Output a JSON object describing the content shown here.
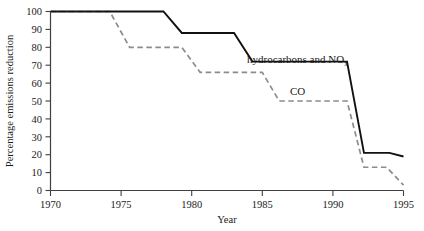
{
  "chart_data": {
    "type": "line",
    "title": "",
    "xlabel": "Year",
    "ylabel": "Percentage emissions reduction",
    "xlim": [
      1970,
      1995
    ],
    "ylim": [
      0,
      100
    ],
    "xticks": [
      1970,
      1975,
      1980,
      1985,
      1990,
      1995
    ],
    "yticks": [
      0,
      10,
      20,
      30,
      40,
      50,
      60,
      70,
      80,
      90,
      100
    ],
    "grid": false,
    "legend_position": "inline-annotation",
    "series": [
      {
        "name": "hydrocarbons and NOx",
        "style": "solid",
        "color": "#111111",
        "label_text": "hydrocarbons and NO",
        "label_subscript": "x",
        "x": [
          1970,
          1978,
          1979.3,
          1983,
          1984.3,
          1991,
          1992.2,
          1994,
          1995
        ],
        "y": [
          100,
          100,
          88,
          88,
          72,
          72,
          21,
          21,
          19
        ]
      },
      {
        "name": "CO",
        "style": "dashed",
        "color": "#8c8c8c",
        "label_text": "CO",
        "x": [
          1970,
          1974.2,
          1975.6,
          1979.3,
          1980.6,
          1985,
          1986.2,
          1991,
          1992.2,
          1993.8,
          1995
        ],
        "y": [
          100,
          100,
          80,
          80,
          66,
          66,
          50,
          50,
          13,
          13,
          3
        ]
      }
    ]
  },
  "axes": {
    "x_title": "Year",
    "y_title": "Percentage emissions reduction",
    "x_tick_labels": [
      "1970",
      "1975",
      "1980",
      "1985",
      "1990",
      "1995"
    ],
    "y_tick_labels": [
      "0",
      "10",
      "20",
      "30",
      "40",
      "50",
      "60",
      "70",
      "80",
      "90",
      "100"
    ]
  },
  "annotations": {
    "hydrocarbons_label": "hydrocarbons and NO",
    "hydrocarbons_subscript": "x",
    "co_label": "CO"
  }
}
